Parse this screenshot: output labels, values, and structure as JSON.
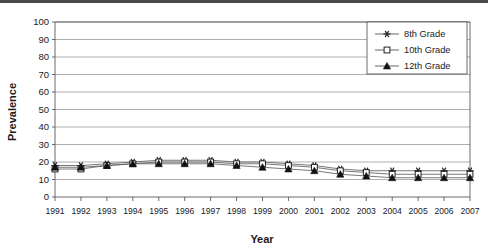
{
  "chart_data": {
    "type": "line",
    "title": "",
    "xlabel": "Year",
    "ylabel": "Prevalence",
    "x": [
      1991,
      1992,
      1993,
      1994,
      1995,
      1996,
      1997,
      1998,
      1999,
      2000,
      2001,
      2002,
      2003,
      2004,
      2005,
      2006,
      2007
    ],
    "categories": [
      "1991",
      "1992",
      "1993",
      "1994",
      "1995",
      "1996",
      "1997",
      "1998",
      "1999",
      "2000",
      "2001",
      "2002",
      "2003",
      "2004",
      "2005",
      "2006",
      "2007"
    ],
    "xlim": [
      1991,
      2007
    ],
    "ylim": [
      0,
      100
    ],
    "yticks": [
      0,
      10,
      20,
      30,
      40,
      50,
      60,
      70,
      80,
      90,
      100
    ],
    "ytick_labels": [
      "0",
      "10",
      "20",
      "30",
      "40",
      "50",
      "60",
      "70",
      "80",
      "90",
      "100"
    ],
    "grid": "horizontal",
    "legend_position": "top-right",
    "series": [
      {
        "name": "8th Grade",
        "marker": "asterisk",
        "color": "#222222",
        "values": [
          18,
          18,
          19,
          20,
          21,
          21,
          21,
          20,
          20,
          19,
          18,
          16,
          15,
          15,
          15,
          15,
          15
        ]
      },
      {
        "name": "10th Grade",
        "marker": "open-square",
        "color": "#222222",
        "values": [
          16,
          16,
          18,
          19,
          20,
          20,
          20,
          19,
          19,
          18,
          17,
          15,
          14,
          13,
          13,
          13,
          13
        ]
      },
      {
        "name": "12th Grade",
        "marker": "filled-triangle",
        "color": "#111111",
        "values": [
          17,
          17,
          18,
          19,
          19,
          19,
          19,
          18,
          17,
          16,
          15,
          13,
          12,
          11,
          11,
          11,
          11
        ]
      }
    ]
  },
  "legend": {
    "entries": [
      {
        "label": "8th Grade"
      },
      {
        "label": "10th Grade"
      },
      {
        "label": "12th Grade"
      }
    ]
  }
}
